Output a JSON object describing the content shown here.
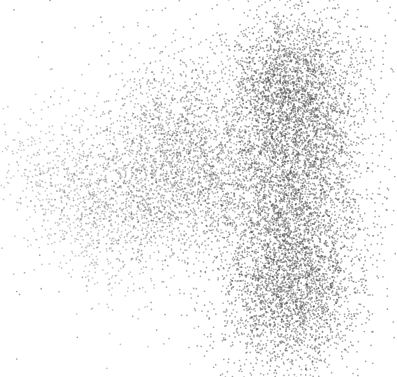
{
  "figure": {
    "width": 397,
    "height": 377,
    "background_color": "#ffffff",
    "has_axes": false,
    "has_frame": false,
    "has_grid": false,
    "has_legend": false,
    "has_title": false,
    "has_tick_labels": false,
    "title": "",
    "xlabel": "",
    "ylabel": ""
  },
  "chart_data": {
    "type": "scatter",
    "title": "",
    "subtitle": "",
    "xlabel": "",
    "ylabel": "",
    "grid": false,
    "legend_position": "none",
    "axis_visible": false,
    "tick_labels_visible": false,
    "xlim": [
      0,
      397
    ],
    "ylim": [
      377,
      0
    ],
    "marker": {
      "shape": "circle",
      "size_px": 1.7,
      "color": "#555555",
      "edge_color": "none",
      "opacity": 0.45
    },
    "background_color": "#ffffff",
    "total_points": 11000,
    "point_color_hex": "#555555",
    "density_description": "Two overlapping elongated gaussian-mixture lobes: a large dense vertical cluster on the right and a broader sparse diagonal cluster trailing to the upper-left, joined by a bridge, with a notch between the upper-middle lobe and the right cluster.",
    "series": [
      {
        "name": "cluster-right-main",
        "n_points": 5200,
        "center_x": 293,
        "center_y": 190,
        "sigma_x": 36,
        "sigma_y": 86,
        "rotation_deg": 6,
        "opacity": 0.5,
        "color": "#4d4d4d"
      },
      {
        "name": "cluster-right-top",
        "n_points": 1500,
        "center_x": 285,
        "center_y": 86,
        "sigma_x": 30,
        "sigma_y": 34,
        "rotation_deg": -8,
        "opacity": 0.5,
        "color": "#4d4d4d"
      },
      {
        "name": "cluster-right-bottom",
        "n_points": 1400,
        "center_x": 297,
        "center_y": 295,
        "sigma_x": 33,
        "sigma_y": 36,
        "rotation_deg": 10,
        "opacity": 0.5,
        "color": "#4d4d4d"
      },
      {
        "name": "cluster-middle-lobe",
        "n_points": 1500,
        "center_x": 193,
        "center_y": 150,
        "sigma_x": 33,
        "sigma_y": 52,
        "rotation_deg": -22,
        "opacity": 0.45,
        "color": "#555555"
      },
      {
        "name": "cluster-bridge",
        "n_points": 900,
        "center_x": 155,
        "center_y": 180,
        "sigma_x": 36,
        "sigma_y": 42,
        "rotation_deg": -30,
        "opacity": 0.42,
        "color": "#595959"
      },
      {
        "name": "cluster-left-sparse",
        "n_points": 800,
        "center_x": 105,
        "center_y": 195,
        "sigma_x": 40,
        "sigma_y": 48,
        "rotation_deg": -35,
        "opacity": 0.38,
        "color": "#5e5e5e"
      },
      {
        "name": "cluster-left-tail",
        "n_points": 420,
        "center_x": 68,
        "center_y": 200,
        "sigma_x": 26,
        "sigma_y": 48,
        "rotation_deg": -40,
        "opacity": 0.35,
        "color": "#636363"
      },
      {
        "name": "scatter-halo-outliers",
        "n_points": 280,
        "center_x": 215,
        "center_y": 190,
        "sigma_x": 95,
        "sigma_y": 95,
        "rotation_deg": 0,
        "opacity": 0.5,
        "color": "#4a4a4a"
      }
    ],
    "bounds": {
      "left_extent_x": 35,
      "right_extent_x": 368,
      "top_extent_y": 32,
      "bottom_extent_y": 350
    }
  }
}
